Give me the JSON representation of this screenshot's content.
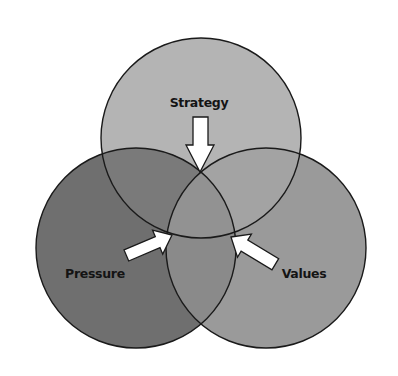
{
  "diagram": {
    "type": "venn",
    "circles": [
      {
        "id": "strategy",
        "label": "Strategy",
        "cx": 201,
        "cy": 138,
        "r": 100,
        "fill": "#b4b4b4"
      },
      {
        "id": "pressure",
        "label": "Pressure",
        "cx": 136,
        "cy": 248,
        "r": 100,
        "fill": "#6f6f6f"
      },
      {
        "id": "values",
        "label": "Values",
        "cx": 266,
        "cy": 248,
        "r": 100,
        "fill": "#9a9a9a"
      }
    ],
    "overlaps": {
      "strategy_pressure": "#7a7a7a",
      "strategy_values": "#a3a3a3",
      "pressure_values": "#8a8a8a",
      "center": "#929292"
    },
    "arrows": [
      {
        "from": "strategy",
        "direction": "down",
        "points_to": "center"
      },
      {
        "from": "pressure",
        "direction": "up-right",
        "points_to": "center"
      },
      {
        "from": "values",
        "direction": "up-left",
        "points_to": "center"
      }
    ],
    "labels": {
      "strategy": "Strategy",
      "pressure": "Pressure",
      "values": "Values"
    },
    "colors": {
      "background": "#ffffff",
      "outline": "#1a1a1a",
      "arrow_fill": "#ffffff",
      "text": "#141414"
    }
  }
}
